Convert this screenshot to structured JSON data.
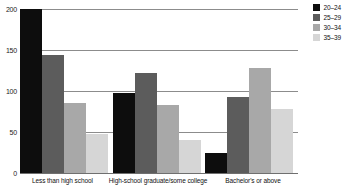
{
  "chart_data": {
    "type": "bar",
    "title": "",
    "subtitle": "",
    "xlabel": "",
    "ylabel": "",
    "ylim": [
      0,
      200
    ],
    "yticks": [
      0,
      50,
      100,
      150,
      200
    ],
    "ytick_labels": [
      "0",
      "50",
      "100",
      "150",
      "200"
    ],
    "grid": true,
    "legend_position": "top-right",
    "categories": [
      "Less than high school",
      "High-school graduate/some college",
      "Bachelor's or above"
    ],
    "series": [
      {
        "name": "20–24",
        "color": "#0d0d0d",
        "values": [
          200,
          98,
          25
        ]
      },
      {
        "name": "25–29",
        "color": "#5c5c5c",
        "values": [
          144,
          122,
          93
        ]
      },
      {
        "name": "30–34",
        "color": "#a8a8a8",
        "values": [
          85,
          83,
          128
        ]
      },
      {
        "name": "35–39",
        "color": "#d6d6d6",
        "values": [
          48,
          40,
          78
        ]
      }
    ]
  },
  "axis": {
    "tick_0": "0",
    "tick_50": "50",
    "tick_100": "100",
    "tick_150": "150",
    "tick_200": "200"
  },
  "legend": {
    "items": [
      {
        "label": "20–24"
      },
      {
        "label": "25–29"
      },
      {
        "label": "30–34"
      },
      {
        "label": "35–39"
      }
    ]
  },
  "categories": {
    "c1": "Less than high school",
    "c2": "High-school graduate/some college",
    "c3": "Bachelor's or above"
  },
  "colors": {
    "series_1": "#0d0d0d",
    "series_2": "#5c5c5c",
    "series_3": "#a8a8a8",
    "series_4": "#d6d6d6",
    "gridline": "#8c8c8c",
    "background": "#ffffff",
    "text": "#111111"
  }
}
